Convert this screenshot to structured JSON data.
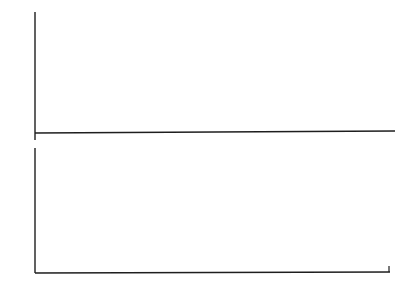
{
  "chart_data": [
    {
      "type": "bar",
      "title": "",
      "xlabel": "i",
      "ylabel": "T̄_i",
      "xlim": [
        0,
        30
      ],
      "ylim": [
        0,
        30
      ],
      "x_ticks": [
        5,
        10,
        15,
        20,
        25,
        30
      ],
      "y_ticks": [
        10,
        20,
        30
      ],
      "grid": false,
      "x": [
        1,
        2,
        4,
        7,
        10,
        13,
        16,
        19,
        22,
        25,
        28,
        30
      ],
      "values": [
        28.0,
        0.7,
        26.0,
        26.0,
        26.0,
        26.3,
        26.4,
        26.5,
        26.7,
        27.0,
        27.2,
        0.8
      ]
    },
    {
      "type": "line",
      "title": "",
      "xlabel": "i",
      "ylabel": "",
      "xlim": [
        0,
        30
      ],
      "ylim": [
        0,
        17
      ],
      "x_ticks": [
        5,
        10,
        15,
        20,
        25,
        30
      ],
      "y_ticks": [
        5,
        10,
        15
      ],
      "grid": false,
      "x": [
        1,
        2,
        3,
        4,
        5,
        6,
        7,
        8,
        9,
        10,
        11,
        12,
        13,
        14,
        15,
        16,
        17,
        18,
        19,
        20,
        21,
        22,
        23,
        24,
        25,
        26,
        27,
        28,
        29,
        30
      ],
      "values": [
        12.5,
        11.3,
        6.5,
        10.2,
        9.7,
        6.5,
        5.9,
        11.6,
        11.6,
        7.9,
        9.0,
        11.3,
        9.3,
        6.5,
        10.5,
        11.0,
        10.4,
        6.8,
        9.3,
        11.5,
        9.6,
        8.0,
        12.0,
        11.8,
        6.3,
        6.9,
        10.2,
        10.8,
        6.9,
        11.9
      ]
    }
  ],
  "top": {
    "ylabel": "T̄",
    "ylabel_sub": "i",
    "y_tick_labels": [
      "30",
      "20",
      "10"
    ],
    "x_tick_labels": [
      "5",
      "10",
      "15",
      "20",
      "25",
      "30"
    ],
    "x_axis_letter": "i"
  },
  "bottom": {
    "y_tick_labels": [
      "15",
      "10",
      "5"
    ],
    "x_tick_labels": [
      "5",
      "10",
      "15",
      "20",
      "25",
      "30"
    ],
    "x_axis_letter": "i"
  }
}
